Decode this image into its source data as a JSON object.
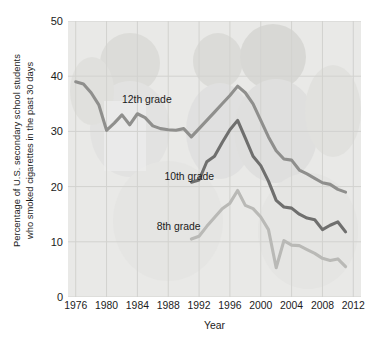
{
  "chart_data": {
    "type": "line",
    "title": "",
    "xlabel": "Year",
    "ylabel_line1": "Percentage of U.S. secondary school students",
    "ylabel_line2": "who smoked cigarettes in the past 30 days",
    "xlim": [
      1975,
      2013
    ],
    "ylim": [
      0,
      50
    ],
    "yticks": [
      0,
      10,
      20,
      30,
      40,
      50
    ],
    "xticks": [
      1976,
      1980,
      1984,
      1988,
      1992,
      1996,
      2000,
      2004,
      2008,
      2012
    ],
    "grid": true,
    "legend_position": "inline-annotations",
    "plot_background": "#e9e9e7",
    "gridline_color": "#d2d2cf",
    "series": [
      {
        "name": "12th grade",
        "color": "#8f8f8d",
        "label_x": 1982.0,
        "label_y": 35.5,
        "x": [
          1976,
          1977,
          1978,
          1979,
          1980,
          1981,
          1982,
          1983,
          1984,
          1985,
          1986,
          1987,
          1988,
          1989,
          1990,
          1991,
          1992,
          1993,
          1994,
          1995,
          1996,
          1997,
          1998,
          1999,
          2000,
          2001,
          2002,
          2003,
          2004,
          2005,
          2006,
          2007,
          2008,
          2009,
          2010,
          2011
        ],
        "values": [
          38.8,
          38.4,
          36.7,
          34.4,
          30.5,
          29.4,
          30.0,
          30.3,
          29.3,
          30.1,
          29.6,
          29.4,
          28.7,
          28.6,
          29.4,
          28.3,
          27.8,
          29.9,
          31.2,
          33.5,
          34.0,
          36.5,
          35.1,
          34.6,
          31.4,
          29.5,
          26.7,
          24.4,
          25.0,
          23.2,
          21.6,
          21.6,
          20.4,
          20.1,
          19.2,
          18.7
        ],
        "smoothed": [
          39.0,
          38.6,
          37.0,
          34.8,
          30.2,
          31.5,
          33.0,
          31.2,
          33.2,
          32.5,
          31.0,
          30.5,
          30.3,
          30.2,
          30.5,
          29.0,
          30.5,
          32.0,
          33.5,
          35.0,
          36.5,
          38.2,
          37.0,
          35.0,
          32.0,
          29.0,
          26.5,
          25.0,
          24.8,
          23.0,
          22.3,
          21.5,
          20.7,
          20.4,
          19.5,
          19.0
        ]
      },
      {
        "name": "10th grade",
        "color": "#6f6f6e",
        "label_x": 1987.5,
        "label_y": 21.5,
        "x": [
          1991,
          1992,
          1993,
          1994,
          1995,
          1996,
          1997,
          1998,
          1999,
          2000,
          2001,
          2002,
          2003,
          2004,
          2005,
          2006,
          2007,
          2008,
          2009,
          2010,
          2011
        ],
        "values": [
          20.8,
          21.5,
          24.7,
          25.4,
          27.9,
          30.4,
          32.0,
          29.0,
          25.7,
          23.9,
          21.3,
          17.7,
          16.7,
          16.0,
          14.9,
          14.5,
          14.0,
          12.3,
          13.1,
          13.6,
          11.8
        ],
        "smoothed": [
          20.8,
          21.2,
          24.5,
          25.5,
          28.0,
          30.3,
          32.0,
          28.8,
          25.5,
          23.8,
          21.0,
          17.5,
          16.3,
          16.1,
          15.0,
          14.3,
          14.0,
          12.2,
          13.0,
          13.6,
          11.8
        ]
      },
      {
        "name": "8th grade",
        "color": "#b9b9b6",
        "label_x": 1986.5,
        "label_y": 12.5,
        "x": [
          1991,
          1992,
          1993,
          1994,
          1995,
          1996,
          1997,
          1998,
          1999,
          2000,
          2001,
          2002,
          2003,
          2004,
          2005,
          2006,
          2007,
          2008,
          2009,
          2010,
          2011
        ],
        "values": [
          10.5,
          11.0,
          12.8,
          14.4,
          16.0,
          17.0,
          19.3,
          16.5,
          16.0,
          14.5,
          12.2,
          5.3,
          10.2,
          9.5,
          9.3,
          8.7,
          7.9,
          7.0,
          6.6,
          6.9,
          5.5
        ],
        "smoothed": [
          10.5,
          11.0,
          12.8,
          14.4,
          16.0,
          17.0,
          19.3,
          16.6,
          16.0,
          14.5,
          12.2,
          5.3,
          10.2,
          9.4,
          9.3,
          8.6,
          7.9,
          7.0,
          6.6,
          6.9,
          5.5
        ]
      }
    ]
  },
  "axis": {
    "x_title": "Year",
    "x_tick_labels": [
      "1976",
      "1980",
      "1984",
      "1988",
      "1992",
      "1996",
      "2000",
      "2004",
      "2008",
      "2012"
    ],
    "y_tick_labels": [
      "0",
      "10",
      "20",
      "30",
      "40",
      "50"
    ],
    "y_title_line1": "Percentage of U.S. secondary school students",
    "y_title_line2": "who smoked cigarettes in the past 30 days"
  },
  "annotations": {
    "grade12": "12th grade",
    "grade10": "10th grade",
    "grade8": "8th grade"
  }
}
